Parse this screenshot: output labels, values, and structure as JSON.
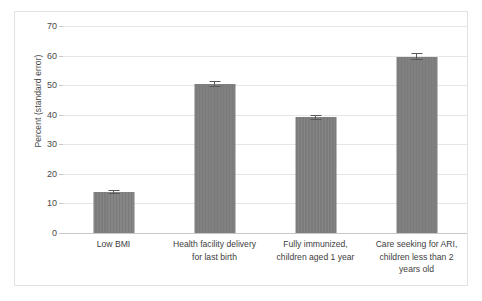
{
  "chart_data": {
    "type": "bar",
    "title": "",
    "xlabel": "",
    "ylabel": "Percent (standard error)",
    "ylim": [
      0,
      70
    ],
    "ytick_step": 10,
    "grid": true,
    "legend": "none",
    "bar_color": "#808080",
    "categories": [
      "Low BMI",
      "Health facility delivery for last birth",
      "Fully immunized, children aged 1 year",
      "Care seeking for ARI, children less than 2 years old"
    ],
    "category_lines": [
      [
        "Low BMI"
      ],
      [
        "Health facility delivery",
        "for last birth"
      ],
      [
        "Fully immunized,",
        "children aged 1 year"
      ],
      [
        "Care seeking for ARI,",
        "children less than 2",
        "years old"
      ]
    ],
    "values": [
      13.8,
      50.4,
      39.1,
      59.6
    ],
    "errors": [
      0.6,
      0.9,
      0.9,
      1.2
    ],
    "ytick_labels": [
      "0",
      "10",
      "20",
      "30",
      "40",
      "50",
      "60",
      "70"
    ],
    "ytick_values": [
      0,
      10,
      20,
      30,
      40,
      50,
      60,
      70
    ]
  }
}
